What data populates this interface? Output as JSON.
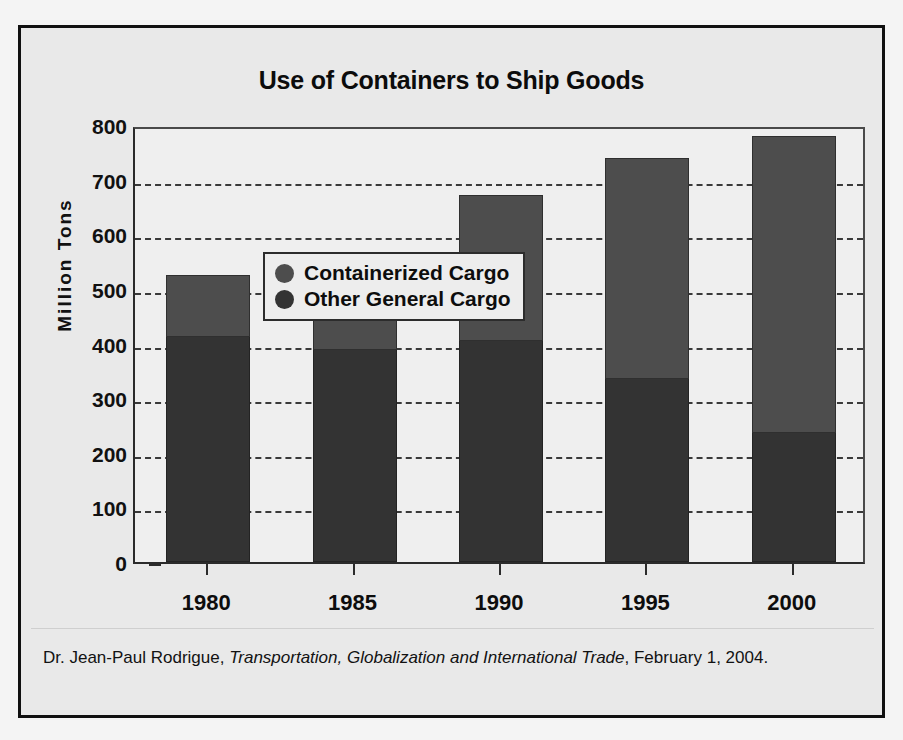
{
  "figure": {
    "background_color": "#e9e9e9",
    "frame_color": "#101010"
  },
  "caption": {
    "author": "Dr. Jean-Paul Rodrigue,",
    "work_title": "Transportation, Globalization and International Trade",
    "date": ", February 1, 2004."
  },
  "chart_data": {
    "type": "bar",
    "subtype": "stacked",
    "title": "Use of Containers to Ship Goods",
    "xlabel": "",
    "ylabel": "Million Tons",
    "categories": [
      "1980",
      "1985",
      "1990",
      "1995",
      "2000"
    ],
    "series": [
      {
        "name": "Containerized Cargo",
        "color": "#4d4d4d",
        "values": [
          113,
          167,
          267,
          405,
          543
        ]
      },
      {
        "name": "Other General Cargo",
        "color": "#333333",
        "values": [
          412,
          388,
          405,
          335,
          237
        ]
      }
    ],
    "totals": [
      525,
      555,
      672,
      740,
      780
    ],
    "ylim": [
      0,
      800
    ],
    "yticks": [
      0,
      100,
      200,
      300,
      400,
      500,
      600,
      700,
      800
    ],
    "ytick_labels": [
      "0",
      "100",
      "200",
      "300",
      "400",
      "500",
      "600",
      "700",
      "800"
    ],
    "grid": true,
    "grid_style": "dashed",
    "grid_axis": "y",
    "legend_position": "upper-left",
    "legend_entries": [
      "Containerized Cargo",
      "Other General Cargo"
    ]
  }
}
